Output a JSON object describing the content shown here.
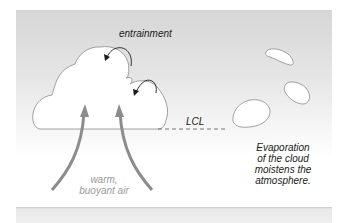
{
  "diagram": {
    "labels": {
      "entrainment": "entrainment",
      "lcl": "LCL",
      "warm_air_line1": "warm,",
      "warm_air_line2": "buoyant air",
      "evaporation_line1": "Evaporation",
      "evaporation_line2": "of the cloud",
      "evaporation_line3": "moistens the",
      "evaporation_line4": "atmosphere."
    },
    "colors": {
      "sky_top": "#d6d6d6",
      "sky_bottom": "#ffffff",
      "cloud_fill": "#ffffff",
      "cloud_outline": "#8a8a8a",
      "updraft_arrow": "#8c8c8c",
      "entrainment_arrow": "#1a1a1a",
      "lcl_dash": "#555555",
      "ground": "#ececec"
    },
    "elements": [
      "main cumulus cloud",
      "two entrainment arrows",
      "two updraft arrows",
      "LCL dashed line",
      "three evaporating cloud fragments"
    ]
  }
}
